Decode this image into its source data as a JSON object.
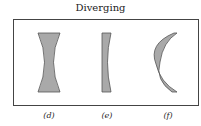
{
  "title": "Diverging",
  "lenses": [
    {
      "id": "d",
      "label": "(d)",
      "type": "biconcave"
    },
    {
      "id": "e",
      "label": "(e)",
      "type": "plano-concave"
    },
    {
      "id": "f",
      "label": "(f)",
      "type": "meniscus-concave"
    }
  ],
  "colors": {
    "lens_fill": "#a9a9a9",
    "lens_stroke": "#555555",
    "frame": "#444444"
  }
}
